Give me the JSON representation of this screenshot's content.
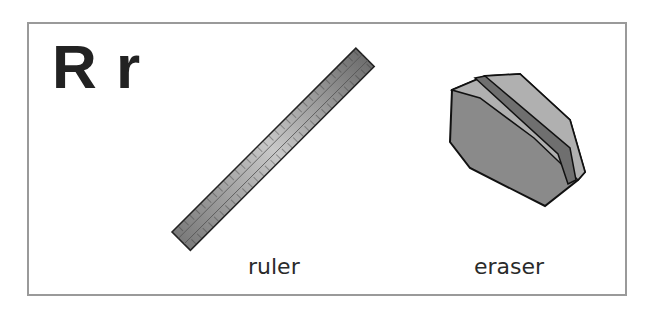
{
  "card": {
    "letters": "R r",
    "items": [
      {
        "name": "ruler",
        "label": "ruler",
        "icon": "ruler-icon"
      },
      {
        "name": "eraser",
        "label": "eraser",
        "icon": "eraser-icon"
      }
    ]
  },
  "colors": {
    "border": "#9a9a9a",
    "text": "#222222",
    "object_gray": "#8f8f8f"
  }
}
